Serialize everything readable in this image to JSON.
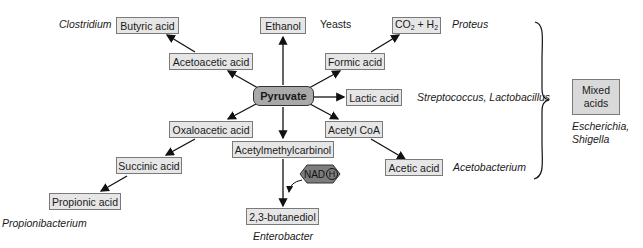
{
  "diagram": {
    "center": "Pyruvate",
    "nodes": {
      "butyric_acid": "Butyric acid",
      "ethanol": "Ethanol",
      "co2": "CO",
      "co2_sub": "2",
      "h2_plus": " + H",
      "h2_sub": "2",
      "acetoacetic_acid": "Acetoacetic acid",
      "formic_acid": "Formic acid",
      "lactic_acid": "Lactic acid",
      "oxaloacetic_acid": "Oxaloacetic acid",
      "acetyl_coa": "Acetyl CoA",
      "acetylmethylcarbinol": "Acetylmethylcarbinol",
      "succinic_acid": "Succinic acid",
      "acetic_acid": "Acetic acid",
      "propionic_acid": "Propionic acid",
      "butanediol": "2,3-butanediol",
      "mixed_line1": "Mixed",
      "mixed_line2": "acids"
    },
    "cofactor": {
      "label": "NAD",
      "circled": "H"
    },
    "organisms": {
      "clostridium": "Clostridium",
      "yeasts": "Yeasts",
      "proteus": "Proteus",
      "strep_lacto": "Streptococcus, Lactobacillus",
      "acetobacterium": "Acetobacterium",
      "escherichia": "Escherichia,",
      "shigella": "Shigella",
      "propionibacterium": "Propionibacterium",
      "enterobacter": "Enterobacter"
    }
  }
}
